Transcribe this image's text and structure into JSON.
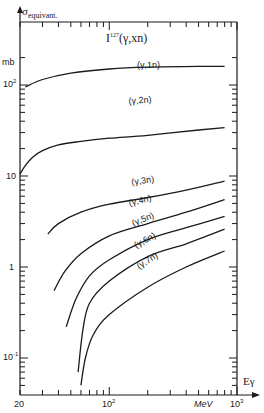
{
  "chart_data": {
    "type": "line",
    "title": "I127(γ,xn)",
    "title_main": "I",
    "title_sup": "127",
    "title_rest": "(γ,xn)",
    "ylabel": "σequivalent",
    "ylabel_main": "σ",
    "ylabel_sub": "equivant.",
    "yunit": "mb",
    "xlabel": "Eγ",
    "xunit": "MeV",
    "xscale": "log",
    "yscale": "log",
    "xlim": [
      20,
      1000
    ],
    "ylim": [
      0.05,
      300
    ],
    "x_ticks": [
      {
        "value": 20,
        "label": "20"
      },
      {
        "value": 100,
        "label": "10",
        "sup": "2"
      },
      {
        "value": 1000,
        "label": "10",
        "sup": "3"
      }
    ],
    "y_ticks": [
      {
        "value": 0.1,
        "label": "10",
        "sup": "-1"
      },
      {
        "value": 1,
        "label": "1",
        "sup": ""
      },
      {
        "value": 10,
        "label": "10",
        "sup": ""
      },
      {
        "value": 100,
        "label": "10",
        "sup": "2"
      }
    ],
    "grid": false,
    "series": [
      {
        "name": "(γ,1n)",
        "x": [
          22,
          30,
          50,
          100,
          200,
          500,
          800
        ],
        "y": [
          95,
          115,
          135,
          150,
          157,
          160,
          160
        ]
      },
      {
        "name": "(γ,2n)",
        "x": [
          20,
          22,
          25,
          30,
          40,
          60,
          100,
          200,
          500,
          800
        ],
        "y": [
          10.5,
          13,
          16,
          19,
          22,
          24,
          26,
          28,
          32,
          34
        ]
      },
      {
        "name": "(γ,3n)",
        "x": [
          33,
          40,
          60,
          100,
          200,
          400,
          800
        ],
        "y": [
          2.3,
          3.0,
          4.0,
          4.9,
          5.8,
          7.0,
          8.8
        ]
      },
      {
        "name": "(γ,4n)",
        "x": [
          37,
          45,
          60,
          100,
          200,
          400,
          800
        ],
        "y": [
          0.55,
          0.9,
          1.4,
          2.2,
          3.0,
          4.0,
          5.5
        ]
      },
      {
        "name": "(γ,5n)",
        "x": [
          46,
          55,
          70,
          100,
          200,
          400,
          800
        ],
        "y": [
          0.22,
          0.45,
          0.8,
          1.2,
          2.0,
          2.7,
          3.6
        ]
      },
      {
        "name": "(γ,6n)",
        "x": [
          57,
          62,
          70,
          100,
          200,
          400,
          800
        ],
        "y": [
          0.07,
          0.2,
          0.4,
          0.7,
          1.3,
          1.8,
          2.6
        ]
      },
      {
        "name": "(γ,7n)",
        "x": [
          60,
          65,
          75,
          100,
          200,
          400,
          800
        ],
        "y": [
          0.05,
          0.1,
          0.18,
          0.3,
          0.6,
          1.0,
          1.5
        ]
      }
    ],
    "curve_labels": [
      {
        "series": "(γ,1n)",
        "text": "(γ,1n)"
      },
      {
        "series": "(γ,2n)",
        "text": "(γ,2n)"
      },
      {
        "series": "(γ,3n)",
        "text": "(γ,3n)"
      },
      {
        "series": "(γ,4n)",
        "text": "(γ,4n)"
      },
      {
        "series": "(γ,5n)",
        "text": "(γ,5n)"
      },
      {
        "series": "(γ,6n)",
        "text": "(γ,6n)"
      },
      {
        "series": "(γ,7n)",
        "text": "(γ,7n)"
      }
    ],
    "line_color": "#1a1a1a"
  }
}
